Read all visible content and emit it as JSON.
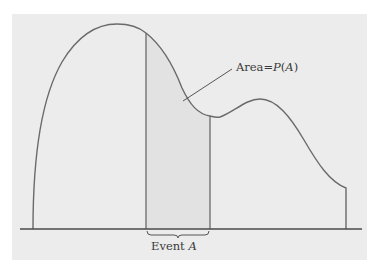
{
  "diagram": {
    "type": "probability-density-area",
    "colors": {
      "background": "#ffffff",
      "panel": "#ececec",
      "curve": "#6a6a6a",
      "axis": "#4a4a4a",
      "shaded_region": "#e2e2e2",
      "text": "#3a3a3a"
    },
    "area_label": {
      "prefix": "Area=",
      "func": "P",
      "open": "(",
      "arg": "A",
      "close": ")"
    },
    "event_label": {
      "prefix": "Event ",
      "arg": "A"
    },
    "curve": {
      "description": "Bimodal density curve: tall peak on left, smaller peak on right, truncated at right end",
      "peak_1": {
        "x": 117,
        "y": 24
      },
      "local_min": {
        "x": 217,
        "y": 118
      },
      "peak_2": {
        "x": 260,
        "y": 99
      },
      "right_end": {
        "x": 346,
        "y": 188
      }
    },
    "shaded_event_region": {
      "x_start": 146,
      "x_end": 210
    }
  }
}
